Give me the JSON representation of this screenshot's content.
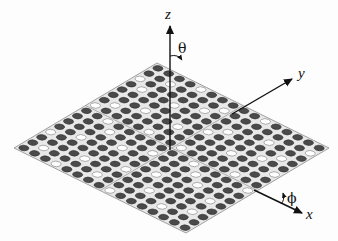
{
  "diagram": {
    "axes": {
      "z": {
        "label": "z",
        "angle_label": "θ"
      },
      "y": {
        "label": "y"
      },
      "x": {
        "label": "x",
        "angle_label": "ϕ"
      }
    },
    "lattice": {
      "rows": 16,
      "cols": 16,
      "filled_color": "#4a4a4a",
      "empty_color": "#ffffff",
      "plate_color": "#e6e6e6",
      "grid": [
        "1110111101111011",
        "1011111110110111",
        "1111011011111101",
        "0111110111011111",
        "1101111111110110",
        "1111101101111111",
        "1011111111011011",
        "1110110111111101",
        "0111111101101111",
        "1111011111110111",
        "1101111011111110",
        "1111110111011111",
        "1011101111111011",
        "1111111101101111",
        "1101011111110111",
        "1111111011011101"
      ]
    }
  }
}
